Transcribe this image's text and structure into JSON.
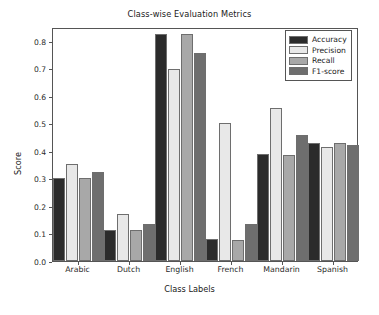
{
  "chart_data": {
    "type": "bar",
    "title": "Class-wise Evaluation Metrics",
    "xlabel": "Class Labels",
    "ylabel": "Score",
    "categories": [
      "Arabic",
      "Dutch",
      "English",
      "French",
      "Mandarin",
      "Spanish"
    ],
    "series": [
      {
        "name": "Accuracy",
        "color": "#2b2b2b",
        "values": [
          0.301,
          0.112,
          0.826,
          0.08,
          0.387,
          0.427
        ]
      },
      {
        "name": "Precision",
        "color": "#e8e8e8",
        "values": [
          0.352,
          0.169,
          0.699,
          0.503,
          0.557,
          0.413
        ]
      },
      {
        "name": "Recall",
        "color": "#a8a8a8",
        "values": [
          0.3,
          0.111,
          0.826,
          0.078,
          0.385,
          0.427
        ]
      },
      {
        "name": "F1-score",
        "color": "#6e6e6e",
        "values": [
          0.325,
          0.136,
          0.757,
          0.136,
          0.458,
          0.42
        ]
      }
    ],
    "ylim": [
      0.0,
      0.85
    ],
    "yticks": [
      "0.0",
      "0.1",
      "0.2",
      "0.3",
      "0.4",
      "0.5",
      "0.6",
      "0.7",
      "0.8"
    ],
    "ytick_values": [
      0.0,
      0.1,
      0.2,
      0.3,
      0.4,
      0.5,
      0.6,
      0.7,
      0.8
    ],
    "grid": false,
    "legend_position": "upper right",
    "bar_edge_color": "#6e6e6e",
    "axes_color": "#555555"
  }
}
